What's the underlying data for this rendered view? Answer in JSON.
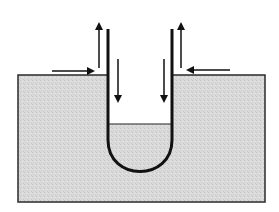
{
  "diagram": {
    "type": "u-tube-in-bath",
    "colors": {
      "background": "#ffffff",
      "bath_fill": "#d9d9d9",
      "bath_border": "#2a2a2a",
      "tube_stroke": "#111111",
      "arrow_color": "#111111",
      "liquid_line": "#222222"
    },
    "bath": {
      "x": 18,
      "y": 75,
      "width": 247,
      "height": 127
    },
    "tube": {
      "left_wall_x": 108,
      "right_wall_x": 172,
      "top_y": 29,
      "liquid_level_y": 124,
      "bottom_y": 180
    },
    "arrows": [
      {
        "name": "left-inflow-arrow",
        "direction": "right",
        "x1": 52,
        "y1": 71,
        "x2": 93,
        "y2": 71
      },
      {
        "name": "left-outflow-arrow",
        "direction": "up",
        "x1": 99,
        "y1": 68,
        "x2": 99,
        "y2": 24
      },
      {
        "name": "left-inner-down-arrow",
        "direction": "down",
        "x1": 118,
        "y1": 59,
        "x2": 118,
        "y2": 101
      },
      {
        "name": "right-inner-down-arrow",
        "direction": "down",
        "x1": 164,
        "y1": 59,
        "x2": 164,
        "y2": 101
      },
      {
        "name": "right-outflow-arrow",
        "direction": "up",
        "x1": 181,
        "y1": 68,
        "x2": 181,
        "y2": 24
      },
      {
        "name": "right-inflow-arrow",
        "direction": "left",
        "x1": 230,
        "y1": 70,
        "x2": 188,
        "y2": 70
      }
    ]
  }
}
